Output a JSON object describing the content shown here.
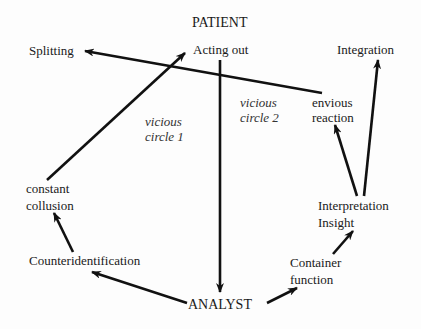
{
  "nodes": {
    "patient": "PATIENT",
    "acting_out": "Acting out",
    "splitting": "Splitting",
    "integration": "Integration",
    "envious_reaction": [
      "envious",
      "reaction"
    ],
    "constant_collusion": [
      "constant",
      "collusion"
    ],
    "interpretation_insight": [
      "Interpretation",
      "Insight"
    ],
    "counteridentification": "Counteridentification",
    "container_function": [
      "Container",
      "function"
    ],
    "analyst": "ANALYST"
  },
  "annotations": {
    "vicious_circle_1": [
      "vicious",
      "circle 1"
    ],
    "vicious_circle_2": [
      "vicious",
      "circle 2"
    ]
  },
  "edges": [
    {
      "from": "analyst",
      "to": "counteridentification"
    },
    {
      "from": "counteridentification",
      "to": "constant_collusion"
    },
    {
      "from": "constant_collusion",
      "to": "acting_out"
    },
    {
      "from": "acting_out",
      "to": "analyst"
    },
    {
      "from": "analyst",
      "to": "container_function"
    },
    {
      "from": "container_function",
      "to": "interpretation_insight"
    },
    {
      "from": "interpretation_insight",
      "to": "envious_reaction"
    },
    {
      "from": "interpretation_insight",
      "to": "integration"
    },
    {
      "from": "envious_reaction",
      "to": "splitting"
    }
  ]
}
